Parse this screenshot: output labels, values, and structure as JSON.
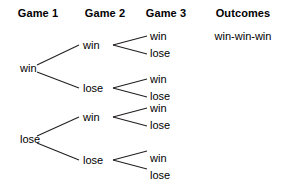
{
  "figure": {
    "type": "probability-tree-diagram",
    "background": "#ffffff",
    "line_color": "#231f20",
    "text_color": "#000000"
  },
  "headers": [
    {
      "label": "Game 1",
      "x": 38
    },
    {
      "label": "Game 2",
      "x": 105
    },
    {
      "label": "Game 3",
      "x": 166
    },
    {
      "label": "Outcomes",
      "x": 243
    }
  ],
  "tree": {
    "level1": [
      {
        "label": "win",
        "x": 20,
        "y": 68
      },
      {
        "label": "lose",
        "x": 20,
        "y": 139
      }
    ],
    "level2": [
      {
        "label": "win",
        "x": 83,
        "y": 45
      },
      {
        "label": "lose",
        "x": 83,
        "y": 88
      },
      {
        "label": "win",
        "x": 83,
        "y": 117
      },
      {
        "label": "lose",
        "x": 83,
        "y": 160
      }
    ],
    "level3": [
      {
        "label": "win",
        "x": 150,
        "y": 36
      },
      {
        "label": "lose",
        "x": 150,
        "y": 53
      },
      {
        "label": "win",
        "x": 150,
        "y": 79
      },
      {
        "label": "lose",
        "x": 150,
        "y": 96
      },
      {
        "label": "win",
        "x": 150,
        "y": 108
      },
      {
        "label": "lose",
        "x": 150,
        "y": 125
      },
      {
        "label": "win",
        "x": 150,
        "y": 158
      },
      {
        "label": "lose",
        "x": 150,
        "y": 175
      }
    ],
    "outcomes": [
      {
        "label": "win-win-win",
        "x": 243,
        "y": 36
      }
    ]
  },
  "edges": [
    {
      "x1": 37,
      "y1": 65,
      "x2": 79,
      "y2": 45
    },
    {
      "x1": 37,
      "y1": 72,
      "x2": 79,
      "y2": 88
    },
    {
      "x1": 37,
      "y1": 136,
      "x2": 79,
      "y2": 117
    },
    {
      "x1": 37,
      "y1": 143,
      "x2": 79,
      "y2": 160
    },
    {
      "x1": 113,
      "y1": 45,
      "x2": 147,
      "y2": 36
    },
    {
      "x1": 113,
      "y1": 45,
      "x2": 147,
      "y2": 54
    },
    {
      "x1": 113,
      "y1": 88,
      "x2": 147,
      "y2": 79
    },
    {
      "x1": 113,
      "y1": 88,
      "x2": 147,
      "y2": 97
    },
    {
      "x1": 113,
      "y1": 117,
      "x2": 147,
      "y2": 108
    },
    {
      "x1": 113,
      "y1": 117,
      "x2": 147,
      "y2": 126
    },
    {
      "x1": 113,
      "y1": 160,
      "x2": 147,
      "y2": 151
    },
    {
      "x1": 113,
      "y1": 160,
      "x2": 147,
      "y2": 169
    }
  ]
}
